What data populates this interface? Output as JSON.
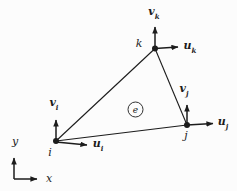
{
  "figure": {
    "element_label": "e",
    "nodes": {
      "i": {
        "label": "i",
        "u_main": "u",
        "u_sub": "i",
        "v_main": "v",
        "v_sub": "i"
      },
      "j": {
        "label": "j",
        "u_main": "u",
        "u_sub": "j",
        "v_main": "v",
        "v_sub": "j"
      },
      "k": {
        "label": "k",
        "u_main": "u",
        "u_sub": "k",
        "v_main": "v",
        "v_sub": "k"
      }
    },
    "axes": {
      "x_label": "x",
      "y_label": "y"
    },
    "colors": {
      "ink": "#1c1c1c",
      "background": "#fcfcfc"
    }
  }
}
